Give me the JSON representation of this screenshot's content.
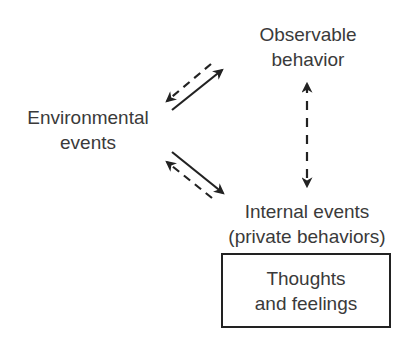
{
  "diagram": {
    "nodes": {
      "observable": {
        "lines": [
          "Observable",
          "behavior"
        ]
      },
      "environmental": {
        "lines": [
          "Environmental",
          "events"
        ]
      },
      "internal": {
        "lines": [
          "Internal events",
          "(private behaviors)"
        ]
      },
      "thoughts": {
        "lines": [
          "Thoughts",
          "and feelings"
        ]
      }
    },
    "edges": [
      {
        "from": "environmental",
        "to": "observable",
        "style": "solid"
      },
      {
        "from": "observable",
        "to": "environmental",
        "style": "dashed"
      },
      {
        "from": "environmental",
        "to": "internal",
        "style": "solid"
      },
      {
        "from": "internal",
        "to": "environmental",
        "style": "dashed"
      },
      {
        "from": "internal",
        "to": "observable",
        "style": "dashed",
        "bidirectional": true
      }
    ],
    "colors": {
      "text": "#3a3a3a",
      "line": "#222222",
      "background": "#ffffff"
    }
  }
}
